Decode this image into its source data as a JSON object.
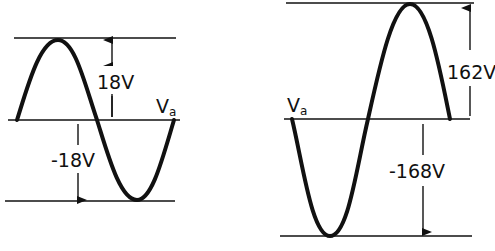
{
  "colors": {
    "ink": "#111111",
    "background": "#ffffff"
  },
  "left_waveform": {
    "positive_peak_label": "18V",
    "negative_peak_label": "-18V",
    "signal_label": "V",
    "signal_subscript": "a"
  },
  "right_waveform": {
    "positive_peak_label": "162V",
    "negative_peak_label": "-168V",
    "signal_label": "V",
    "signal_subscript": "a"
  }
}
